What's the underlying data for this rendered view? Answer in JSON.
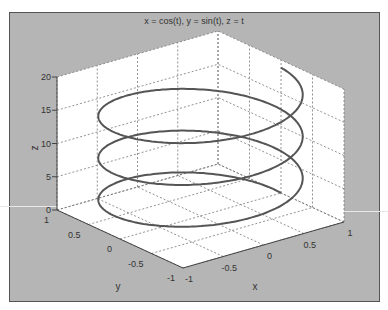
{
  "chart_data": {
    "type": "line3d",
    "title": "x = cos(t), y = sin(t), z = t",
    "xlabel": "x",
    "ylabel": "y",
    "zlabel": "z",
    "xlim": [
      -1,
      1
    ],
    "ylim": [
      -1,
      1
    ],
    "zlim": [
      0,
      20
    ],
    "xticks": [
      "-1",
      "-0.5",
      "0",
      "0.5",
      "1"
    ],
    "yticks": [
      "-1",
      "-0.5",
      "0",
      "0.5",
      "1"
    ],
    "zticks": [
      "0",
      "5",
      "10",
      "15",
      "20"
    ],
    "grid": true,
    "series": [
      {
        "name": "helix",
        "x_expr": "cos(t)",
        "y_expr": "sin(t)",
        "z_expr": "t",
        "t_range": [
          0,
          18.85
        ],
        "color": "#555555"
      }
    ]
  },
  "colors": {
    "figure_bg": "#b5b5b5",
    "axes_bg": "#ffffff",
    "grid": "#777777",
    "line": "#555555"
  }
}
